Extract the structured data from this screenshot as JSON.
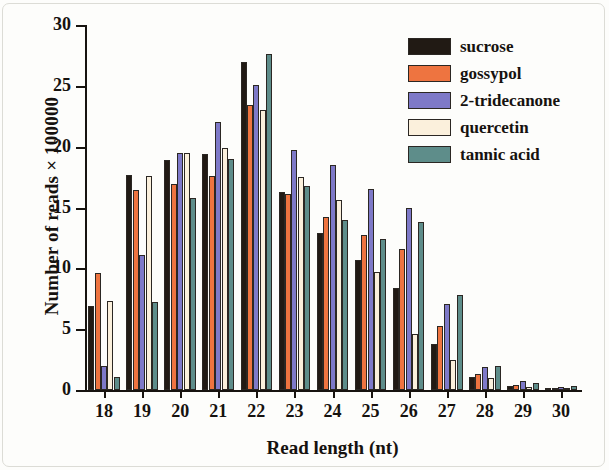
{
  "chart_data": {
    "type": "bar",
    "title": "",
    "xlabel": "Read length (nt)",
    "ylabel": "Number of reads × 100000",
    "categories": [
      "18",
      "19",
      "20",
      "21",
      "22",
      "23",
      "24",
      "25",
      "26",
      "27",
      "28",
      "29",
      "30"
    ],
    "ylim": [
      0,
      30
    ],
    "yticks": [
      "0",
      "5",
      "10",
      "15",
      "20",
      "25",
      "30"
    ],
    "grid": false,
    "legend_position": "top-right",
    "series": [
      {
        "name": "sucrose",
        "color": "#211a14",
        "values": [
          6.9,
          17.7,
          18.9,
          19.4,
          27.0,
          16.3,
          12.9,
          10.7,
          8.4,
          3.8,
          1.1,
          0.35,
          0.12
        ]
      },
      {
        "name": "gossypol",
        "color": "#ee7440",
        "values": [
          9.6,
          16.4,
          16.9,
          17.6,
          23.4,
          16.1,
          14.2,
          12.7,
          11.6,
          5.3,
          1.3,
          0.45,
          0.18
        ]
      },
      {
        "name": "2-tridecanone",
        "color": "#7e79c8",
        "values": [
          2.0,
          11.1,
          19.5,
          22.0,
          25.1,
          19.7,
          18.5,
          16.5,
          15.0,
          7.1,
          1.9,
          0.7,
          0.25
        ]
      },
      {
        "name": "quercetin",
        "color": "#fbf0dc",
        "values": [
          7.3,
          17.6,
          19.5,
          19.9,
          23.0,
          17.5,
          15.6,
          9.7,
          4.6,
          2.5,
          1.0,
          0.25,
          0.15
        ]
      },
      {
        "name": "tannic acid",
        "color": "#5e8d8a",
        "values": [
          1.1,
          7.2,
          15.8,
          19.0,
          27.6,
          16.8,
          14.0,
          12.4,
          13.8,
          7.8,
          2.0,
          0.6,
          0.3
        ]
      }
    ]
  }
}
